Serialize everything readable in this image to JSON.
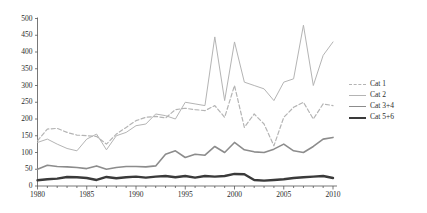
{
  "chart_data": {
    "type": "line",
    "title": "",
    "xlabel": "",
    "ylabel": "",
    "xlim": [
      1980,
      2010
    ],
    "ylim": [
      0,
      500
    ],
    "ytick_step": 50,
    "xtick_step": 5,
    "xminor_step": 1,
    "grid": false,
    "legend_position": "right",
    "yticks": [
      "0",
      "50",
      "100",
      "150",
      "200",
      "250",
      "300",
      "350",
      "400",
      "450",
      "500"
    ],
    "xticks": [
      "1980",
      "1985",
      "1990",
      "1995",
      "2000",
      "2005",
      "2010"
    ],
    "x": [
      1980,
      1981,
      1982,
      1983,
      1984,
      1985,
      1986,
      1987,
      1988,
      1989,
      1990,
      1991,
      1992,
      1993,
      1994,
      1995,
      1996,
      1997,
      1998,
      1999,
      2000,
      2001,
      2002,
      2003,
      2004,
      2005,
      2006,
      2007,
      2008,
      2009,
      2010
    ],
    "series": [
      {
        "name": "Cat 1",
        "style": "dashed",
        "color": "#b4b4b4",
        "width": 1.2,
        "values": [
          135,
          170,
          172,
          160,
          152,
          150,
          148,
          125,
          155,
          175,
          195,
          205,
          208,
          203,
          228,
          232,
          228,
          225,
          240,
          205,
          300,
          175,
          215,
          185,
          120,
          205,
          235,
          250,
          200,
          245,
          240
        ]
      },
      {
        "name": "Cat 2",
        "style": "solid",
        "color": "#b4b4b4",
        "width": 1.0,
        "values": [
          130,
          140,
          125,
          112,
          105,
          140,
          155,
          108,
          150,
          160,
          180,
          185,
          215,
          210,
          200,
          250,
          245,
          240,
          445,
          255,
          430,
          310,
          300,
          290,
          255,
          310,
          320,
          480,
          300,
          390,
          430
        ]
      },
      {
        "name": "Cat 3+4",
        "style": "solid",
        "color": "#8c8c8c",
        "width": 1.6,
        "values": [
          50,
          62,
          58,
          57,
          55,
          52,
          60,
          50,
          55,
          58,
          58,
          57,
          60,
          95,
          105,
          85,
          95,
          92,
          118,
          100,
          130,
          108,
          102,
          100,
          110,
          125,
          105,
          100,
          118,
          140,
          145
        ]
      },
      {
        "name": "Cat 5+6",
        "style": "solid",
        "color": "#3a3a3a",
        "width": 2.4,
        "values": [
          17,
          20,
          22,
          27,
          26,
          24,
          18,
          27,
          23,
          26,
          28,
          25,
          28,
          30,
          26,
          30,
          25,
          30,
          28,
          30,
          36,
          35,
          18,
          16,
          18,
          20,
          24,
          26,
          28,
          30,
          24
        ]
      }
    ]
  },
  "legend": {
    "items": [
      {
        "label": "Cat 1"
      },
      {
        "label": "Cat 2"
      },
      {
        "label": "Cat 3+4"
      },
      {
        "label": "Cat 5+6"
      }
    ]
  }
}
